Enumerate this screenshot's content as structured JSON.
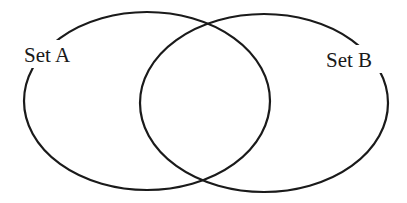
{
  "diagram": {
    "type": "venn",
    "background_color": "#ffffff",
    "stroke_color": "#1a1a1a",
    "sets": [
      {
        "id": "A",
        "label": "Set A",
        "ellipse": {
          "cx": 147,
          "cy": 101,
          "rx": 123,
          "ry": 89
        },
        "label_position": {
          "x": 24,
          "y": 62
        }
      },
      {
        "id": "B",
        "label": "Set B",
        "ellipse": {
          "cx": 264,
          "cy": 103,
          "rx": 124,
          "ry": 89
        },
        "label_position": {
          "x": 326,
          "y": 67
        }
      }
    ],
    "intersection": {
      "label": ""
    }
  }
}
